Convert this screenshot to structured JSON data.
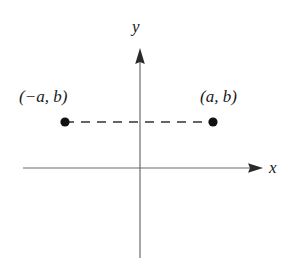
{
  "figure": {
    "type": "coordinate-plane-diagram",
    "background_color": "#ffffff",
    "axis_color": "#6b6b6b",
    "ink_color": "#1a1a1a",
    "axes": {
      "x_label": "x",
      "y_label": "y",
      "x_axis": {
        "start_x": 23,
        "end_x": 263,
        "y": 168,
        "has_arrowhead": true,
        "arrow_direction": "right"
      },
      "y_axis": {
        "x": 140,
        "start_y": 48,
        "end_y": 258,
        "has_arrowhead": true,
        "arrow_direction": "up"
      },
      "origin": {
        "x": 140,
        "y": 168
      }
    },
    "points": [
      {
        "name": "left-point",
        "label": "(−a, b)",
        "cx": 65,
        "cy": 122,
        "radius": 4.5,
        "color": "#111111"
      },
      {
        "name": "right-point",
        "label": "(a, b)",
        "cx": 213,
        "cy": 122,
        "radius": 4.5,
        "color": "#111111"
      }
    ],
    "connector": {
      "name": "dashed-segment",
      "style": "dashed",
      "dash_pattern": "9 7",
      "from_x": 65,
      "to_x": 213,
      "y": 122,
      "color": "#333333"
    }
  }
}
